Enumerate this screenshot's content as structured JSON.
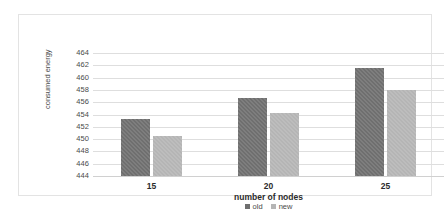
{
  "chart_data": {
    "type": "bar",
    "title": "",
    "xlabel": "number of nodes",
    "ylabel": "consumed energy",
    "categories": [
      "15",
      "20",
      "25"
    ],
    "series": [
      {
        "name": "old",
        "color": "#6f6f6f",
        "values": [
          453.2,
          456.7,
          461.5
        ]
      },
      {
        "name": "new",
        "color": "#b5b5b5",
        "values": [
          450.5,
          454.2,
          458.0
        ]
      }
    ],
    "ylim": [
      444,
      464
    ],
    "ytick_step": 2,
    "yticks": [
      "464",
      "462",
      "460",
      "458",
      "456",
      "454",
      "452",
      "450",
      "448",
      "446",
      "444"
    ],
    "grid": true,
    "legend_position": "bottom"
  },
  "legend": {
    "items": [
      {
        "label": "old"
      },
      {
        "label": "new"
      }
    ]
  }
}
